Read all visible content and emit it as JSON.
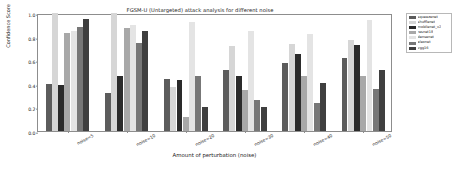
{
  "chart_data": {
    "type": "bar",
    "title": "FGSM-U (Untargeted) attack analysis for different noise",
    "xlabel": "Amount of perturbation (noise)",
    "ylabel": "Confidence Score",
    "categories": [
      "noise=5",
      "noise=10",
      "noise=20",
      "noise=30",
      "noise=40",
      "noise=50"
    ],
    "ylim": [
      0.0,
      1.0
    ],
    "yticks": [
      "0.0",
      "0.2",
      "0.4",
      "0.6",
      "0.8",
      "1.0"
    ],
    "ytick_values": [
      0.0,
      0.2,
      0.4,
      0.6,
      0.8,
      1.0
    ],
    "grid": false,
    "legend_position": "outside right upper",
    "series": [
      {
        "name": "squeezenet",
        "color": "#5c5c5c",
        "values": [
          0.4,
          0.32,
          0.44,
          0.52,
          0.58,
          0.62
        ]
      },
      {
        "name": "shufflenet",
        "color": "#d6d6d6",
        "values": [
          1.0,
          1.0,
          0.37,
          0.72,
          0.74,
          0.77
        ]
      },
      {
        "name": "mobilenet_v2",
        "color": "#2b2b2b",
        "values": [
          0.39,
          0.47,
          0.43,
          0.47,
          0.65,
          0.73
        ]
      },
      {
        "name": "resnet18",
        "color": "#a8a8a8",
        "values": [
          0.83,
          0.87,
          0.12,
          0.35,
          0.47,
          0.47
        ]
      },
      {
        "name": "densenet",
        "color": "#e4e4e4",
        "values": [
          0.85,
          0.9,
          0.92,
          0.85,
          0.82,
          0.94
        ]
      },
      {
        "name": "alexnet",
        "color": "#777777",
        "values": [
          0.88,
          0.75,
          0.47,
          0.26,
          0.24,
          0.36
        ]
      },
      {
        "name": "vgg16",
        "color": "#3f3f3f",
        "values": [
          0.95,
          0.85,
          0.2,
          0.2,
          0.41,
          0.52
        ]
      }
    ]
  }
}
